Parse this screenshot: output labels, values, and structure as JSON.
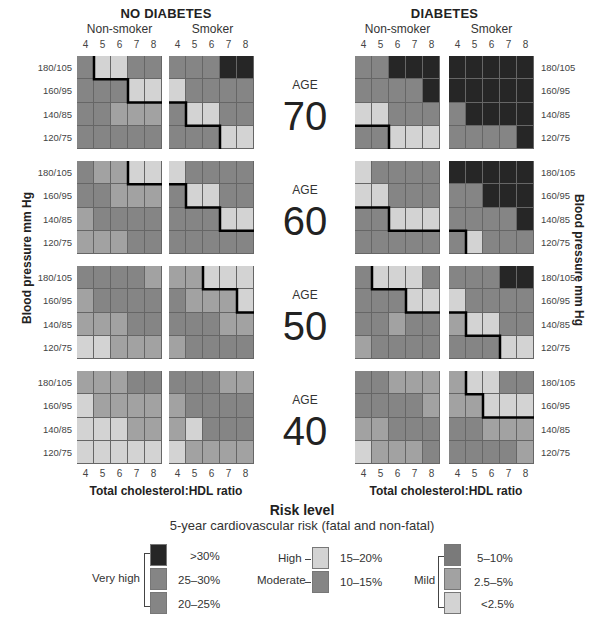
{
  "chart_data": {
    "type": "heatmap",
    "title": "Risk level",
    "subtitle": "5-year cardiovascular risk (fatal and non-fatal)",
    "xlabel": "Total cholesterol:HDL ratio",
    "ylabel": "Blood pressure mm Hg",
    "x_ticks": [
      "4",
      "5",
      "6",
      "7",
      "8"
    ],
    "y_ticks": [
      "180/105",
      "160/95",
      "140/85",
      "120/75"
    ],
    "groups": [
      {
        "label": "NO DIABETES",
        "subgroups": [
          "Non-smoker",
          "Smoker"
        ]
      },
      {
        "label": "DIABETES",
        "subgroups": [
          "Non-smoker",
          "Smoker"
        ]
      }
    ],
    "ages": [
      {
        "label": "AGE",
        "value": "70"
      },
      {
        "label": "AGE",
        "value": "60"
      },
      {
        "label": "AGE",
        "value": "50"
      },
      {
        "label": "AGE",
        "value": "40"
      }
    ],
    "shade_legend": {
      "L": "light",
      "M": "medium",
      "D": "dark",
      "K": "black"
    },
    "shade_colors": {
      "L": "#d3d3d3",
      "M": "#a2a2a2",
      "D": "#858585",
      "K": "#262626"
    },
    "grids": [
      {
        "age": "70",
        "diabetes": false,
        "smoker": false,
        "cells": [
          [
            "D",
            "L",
            "L",
            "D",
            "D"
          ],
          [
            "D",
            "D",
            "D",
            "L",
            "L"
          ],
          [
            "D",
            "D",
            "M",
            "M",
            "M"
          ],
          [
            "D",
            "D",
            "D",
            "D",
            "D"
          ]
        ],
        "line": [
          [
            1,
            0
          ],
          [
            1,
            1
          ],
          [
            3,
            1
          ],
          [
            3,
            2
          ],
          [
            5,
            2
          ]
        ]
      },
      {
        "age": "70",
        "diabetes": false,
        "smoker": true,
        "cells": [
          [
            "D",
            "D",
            "D",
            "K",
            "K"
          ],
          [
            "L",
            "D",
            "D",
            "D",
            "D"
          ],
          [
            "D",
            "L",
            "L",
            "D",
            "D"
          ],
          [
            "D",
            "D",
            "D",
            "L",
            "L"
          ]
        ],
        "line": [
          [
            0,
            2
          ],
          [
            1,
            2
          ],
          [
            1,
            3
          ],
          [
            3,
            3
          ],
          [
            3,
            4
          ]
        ]
      },
      {
        "age": "70",
        "diabetes": true,
        "smoker": false,
        "cells": [
          [
            "D",
            "D",
            "K",
            "K",
            "K"
          ],
          [
            "D",
            "D",
            "D",
            "D",
            "K"
          ],
          [
            "L",
            "L",
            "D",
            "D",
            "D"
          ],
          [
            "D",
            "D",
            "L",
            "L",
            "L"
          ]
        ],
        "line": [
          [
            0,
            3
          ],
          [
            2,
            3
          ],
          [
            2,
            4
          ]
        ]
      },
      {
        "age": "70",
        "diabetes": true,
        "smoker": true,
        "cells": [
          [
            "K",
            "K",
            "K",
            "K",
            "K"
          ],
          [
            "K",
            "K",
            "K",
            "K",
            "K"
          ],
          [
            "D",
            "K",
            "K",
            "K",
            "K"
          ],
          [
            "D",
            "D",
            "D",
            "D",
            "K"
          ]
        ],
        "line": []
      },
      {
        "age": "60",
        "diabetes": false,
        "smoker": false,
        "cells": [
          [
            "D",
            "M",
            "M",
            "L",
            "L"
          ],
          [
            "D",
            "D",
            "M",
            "M",
            "M"
          ],
          [
            "M",
            "D",
            "D",
            "D",
            "D"
          ],
          [
            "M",
            "M",
            "M",
            "D",
            "D"
          ]
        ],
        "line": [
          [
            3,
            0
          ],
          [
            3,
            1
          ],
          [
            5,
            1
          ]
        ]
      },
      {
        "age": "60",
        "diabetes": false,
        "smoker": true,
        "cells": [
          [
            "L",
            "D",
            "D",
            "D",
            "D"
          ],
          [
            "D",
            "L",
            "L",
            "D",
            "D"
          ],
          [
            "D",
            "D",
            "D",
            "L",
            "L"
          ],
          [
            "D",
            "D",
            "D",
            "D",
            "D"
          ]
        ],
        "line": [
          [
            0,
            1
          ],
          [
            1,
            1
          ],
          [
            1,
            2
          ],
          [
            3,
            2
          ],
          [
            3,
            3
          ],
          [
            5,
            3
          ]
        ]
      },
      {
        "age": "60",
        "diabetes": true,
        "smoker": false,
        "cells": [
          [
            "L",
            "D",
            "D",
            "D",
            "D"
          ],
          [
            "L",
            "L",
            "D",
            "D",
            "D"
          ],
          [
            "D",
            "D",
            "L",
            "L",
            "L"
          ],
          [
            "D",
            "D",
            "D",
            "D",
            "D"
          ]
        ],
        "line": [
          [
            0,
            2
          ],
          [
            2,
            2
          ],
          [
            2,
            3
          ],
          [
            5,
            3
          ]
        ]
      },
      {
        "age": "60",
        "diabetes": true,
        "smoker": true,
        "cells": [
          [
            "K",
            "K",
            "K",
            "K",
            "K"
          ],
          [
            "D",
            "D",
            "K",
            "K",
            "K"
          ],
          [
            "D",
            "D",
            "D",
            "D",
            "K"
          ],
          [
            "D",
            "L",
            "D",
            "D",
            "D"
          ]
        ],
        "line": [
          [
            0,
            3
          ],
          [
            1,
            3
          ],
          [
            1,
            4
          ]
        ]
      },
      {
        "age": "50",
        "diabetes": false,
        "smoker": false,
        "cells": [
          [
            "D",
            "D",
            "D",
            "D",
            "M"
          ],
          [
            "M",
            "D",
            "D",
            "D",
            "D"
          ],
          [
            "M",
            "M",
            "M",
            "D",
            "D"
          ],
          [
            "L",
            "L",
            "M",
            "M",
            "M"
          ]
        ],
        "line": []
      },
      {
        "age": "50",
        "diabetes": false,
        "smoker": true,
        "cells": [
          [
            "M",
            "M",
            "L",
            "L",
            "L"
          ],
          [
            "D",
            "M",
            "M",
            "M",
            "L"
          ],
          [
            "D",
            "D",
            "D",
            "M",
            "M"
          ],
          [
            "M",
            "D",
            "D",
            "D",
            "D"
          ]
        ],
        "line": [
          [
            2,
            0
          ],
          [
            2,
            1
          ],
          [
            4,
            1
          ],
          [
            4,
            2
          ],
          [
            5,
            2
          ]
        ]
      },
      {
        "age": "50",
        "diabetes": true,
        "smoker": false,
        "cells": [
          [
            "D",
            "L",
            "L",
            "L",
            "D"
          ],
          [
            "D",
            "D",
            "D",
            "L",
            "L"
          ],
          [
            "D",
            "D",
            "M",
            "D",
            "D"
          ],
          [
            "M",
            "D",
            "D",
            "D",
            "D"
          ]
        ],
        "line": [
          [
            1,
            0
          ],
          [
            1,
            1
          ],
          [
            3,
            1
          ],
          [
            3,
            2
          ],
          [
            5,
            2
          ]
        ]
      },
      {
        "age": "50",
        "diabetes": true,
        "smoker": true,
        "cells": [
          [
            "D",
            "D",
            "D",
            "K",
            "K"
          ],
          [
            "L",
            "D",
            "D",
            "D",
            "D"
          ],
          [
            "M",
            "L",
            "L",
            "D",
            "D"
          ],
          [
            "D",
            "D",
            "D",
            "L",
            "L"
          ]
        ],
        "line": [
          [
            0,
            2
          ],
          [
            1,
            2
          ],
          [
            1,
            3
          ],
          [
            3,
            3
          ],
          [
            3,
            4
          ]
        ]
      },
      {
        "age": "40",
        "diabetes": false,
        "smoker": false,
        "cells": [
          [
            "M",
            "M",
            "M",
            "D",
            "D"
          ],
          [
            "L",
            "M",
            "M",
            "M",
            "M"
          ],
          [
            "L",
            "L",
            "L",
            "M",
            "M"
          ],
          [
            "L",
            "L",
            "L",
            "L",
            "L"
          ]
        ],
        "line": []
      },
      {
        "age": "40",
        "diabetes": false,
        "smoker": true,
        "cells": [
          [
            "D",
            "D",
            "D",
            "M",
            "M"
          ],
          [
            "M",
            "D",
            "D",
            "D",
            "D"
          ],
          [
            "M",
            "L",
            "D",
            "D",
            "D"
          ],
          [
            "L",
            "M",
            "M",
            "M",
            "M"
          ]
        ],
        "line": []
      },
      {
        "age": "40",
        "diabetes": true,
        "smoker": false,
        "cells": [
          [
            "D",
            "D",
            "M",
            "M",
            "M"
          ],
          [
            "D",
            "D",
            "D",
            "D",
            "M"
          ],
          [
            "M",
            "M",
            "D",
            "D",
            "D"
          ],
          [
            "L",
            "M",
            "M",
            "M",
            "D"
          ]
        ],
        "line": []
      },
      {
        "age": "40",
        "diabetes": true,
        "smoker": true,
        "cells": [
          [
            "M",
            "L",
            "L",
            "D",
            "D"
          ],
          [
            "M",
            "M",
            "L",
            "L",
            "L"
          ],
          [
            "D",
            "D",
            "M",
            "M",
            "M"
          ],
          [
            "D",
            "D",
            "D",
            "D",
            "M"
          ]
        ],
        "line": [
          [
            1,
            0
          ],
          [
            1,
            1
          ],
          [
            2,
            1
          ],
          [
            2,
            2
          ],
          [
            5,
            2
          ]
        ]
      }
    ],
    "legend": {
      "title": "Risk level",
      "subtitle": "5-year cardiovascular risk (fatal and non-fatal)",
      "groups": [
        {
          "label": "Very high",
          "items": [
            {
              "range": ">30%",
              "shade": "K"
            },
            {
              "range": "25–30%",
              "shade": "D"
            },
            {
              "range": "20–25%",
              "shade": "D"
            }
          ]
        },
        {
          "label": "High",
          "items": [
            {
              "range": "15–20%",
              "shade": "L"
            }
          ]
        },
        {
          "label": "Moderate",
          "items": [
            {
              "range": "10–15%",
              "shade": "D"
            }
          ]
        },
        {
          "label": "Mild",
          "items": [
            {
              "range": "5–10%",
              "shade": "D"
            },
            {
              "range": "2.5–5%",
              "shade": "M"
            },
            {
              "range": "<2.5%",
              "shade": "L"
            }
          ]
        }
      ]
    }
  },
  "labels": {
    "no_diabetes": "NO DIABETES",
    "diabetes": "DIABETES",
    "non_smoker": "Non-smoker",
    "smoker": "Smoker",
    "age": "AGE",
    "xlabel": "Total cholesterol:HDL ratio",
    "ylabel": "Blood pressure mm Hg",
    "risk_title": "Risk level",
    "risk_subtitle": "5-year cardiovascular risk (fatal and non-fatal)",
    "very_high": "Very high",
    "high": "High",
    "moderate": "Moderate",
    "mild": "Mild",
    "r30": ">30%",
    "r25": "25–30%",
    "r20": "20–25%",
    "r15": "15–20%",
    "r10": "10–15%",
    "r5": "5–10%",
    "r25b": "2.5–5%",
    "r0": "<2.5%"
  }
}
